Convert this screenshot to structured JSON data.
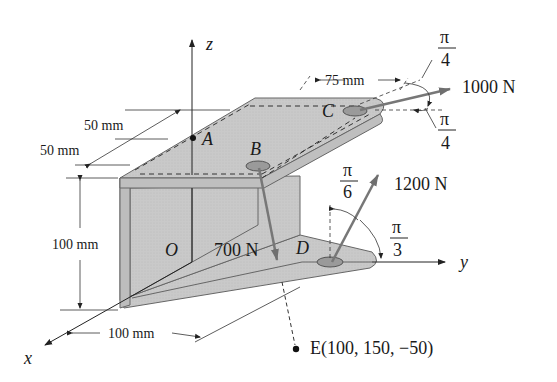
{
  "figure": {
    "axes": {
      "x": "x",
      "y": "y",
      "z": "z",
      "origin": "O"
    },
    "points": {
      "A": "A",
      "B": "B",
      "C": "C",
      "D": "D",
      "E": "E(100, 150, −50)"
    },
    "dimensions": {
      "top_offset_1": "50 mm",
      "top_offset_2": "50 mm",
      "height": "100 mm",
      "base_x": "100 mm",
      "c_span": "75 mm"
    },
    "forces": {
      "at_C": {
        "label": "1000 N",
        "angle_top_num": "π",
        "angle_top_den": "4",
        "angle_bottom_num": "π",
        "angle_bottom_den": "4"
      },
      "at_D": {
        "label": "1200 N",
        "angle_a_num": "π",
        "angle_a_den": "6",
        "angle_b_num": "π",
        "angle_b_den": "3"
      },
      "at_B": {
        "label": "700 N"
      }
    },
    "colors": {
      "plate_fill": "#c8c8c8",
      "plate_edge": "#6e6e6e",
      "force_arrow": "#777777",
      "text": "#1a1a1a"
    }
  }
}
